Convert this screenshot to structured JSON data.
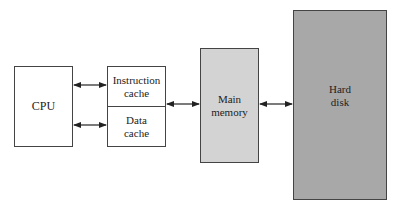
{
  "diagram": {
    "nodes": [
      {
        "id": "cpu",
        "label": "CPU"
      },
      {
        "id": "icache",
        "label_line1": "Instruction",
        "label_line2": "cache"
      },
      {
        "id": "dcache",
        "label_line1": "Data",
        "label_line2": "cache"
      },
      {
        "id": "mem",
        "label_line1": "Main",
        "label_line2": "memory"
      },
      {
        "id": "disk",
        "label_line1": "Hard",
        "label_line2": "disk"
      }
    ],
    "edges": [
      {
        "from": "cpu",
        "to": "icache",
        "type": "bidirectional"
      },
      {
        "from": "cpu",
        "to": "dcache",
        "type": "bidirectional"
      },
      {
        "from": "cache",
        "to": "mem",
        "type": "bidirectional"
      },
      {
        "from": "mem",
        "to": "disk",
        "type": "bidirectional"
      }
    ],
    "colors": {
      "cpu_fill": "#ffffff",
      "cache_fill": "#ffffff",
      "memory_fill": "#d3d3d3",
      "disk_fill": "#a8a8a8",
      "stroke": "#444444"
    }
  }
}
